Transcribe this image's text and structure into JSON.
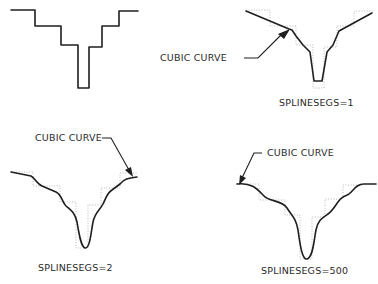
{
  "colors": {
    "background": "#ffffff",
    "ink": "#1f1f1f",
    "frame": "#9a9a9a"
  },
  "panels": [
    {
      "id": "control-polyline",
      "label": null,
      "callout": null
    },
    {
      "id": "splinesegs-1",
      "label": "SPLINESEGS=1",
      "callout": "CUBIC CURVE"
    },
    {
      "id": "splinesegs-2",
      "label": "SPLINESEGS=2",
      "callout": "CUBIC CURVE"
    },
    {
      "id": "splinesegs-500",
      "label": "SPLINESEGS=500",
      "callout": "CUBIC CURVE"
    }
  ]
}
